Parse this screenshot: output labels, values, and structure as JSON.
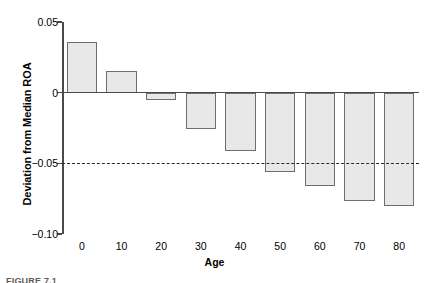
{
  "chart_data": {
    "type": "bar",
    "title": "",
    "xlabel": "Age",
    "ylabel": "Deviation from Median ROA",
    "categories": [
      "0",
      "10",
      "20",
      "30",
      "40",
      "50",
      "60",
      "70",
      "80"
    ],
    "values": [
      0.036,
      0.015,
      -0.005,
      -0.026,
      -0.041,
      -0.056,
      -0.066,
      -0.077,
      -0.08
    ],
    "ylim": [
      -0.1,
      0.05
    ],
    "yticks": [
      0.05,
      0,
      -0.05,
      -0.1
    ],
    "ytick_labels": [
      "0.05",
      "0",
      "−0.05",
      "−0.10"
    ],
    "grid": false,
    "legend": "none",
    "reference_line": {
      "value": -0.05,
      "style": "dashed",
      "color": "#2b2b2b"
    },
    "zero_line": {
      "value": 0,
      "style": "solid",
      "color": "#4a4a4a"
    },
    "bar_fill_color": "#e8e8e8",
    "bar_edge_color": "#6e6e6e"
  },
  "figure": {
    "caption": "FIGURE 7.1"
  }
}
